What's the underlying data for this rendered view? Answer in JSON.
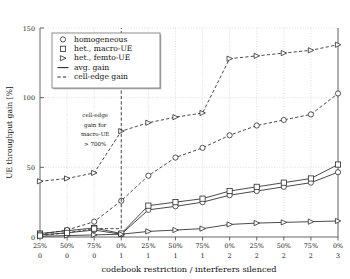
{
  "chart_data": {
    "type": "line",
    "title": "",
    "xlabel": "codebook restriction / interferers silenced",
    "ylabel": "UE throughput gain [%]",
    "ylim": [
      0,
      150
    ],
    "yticks": [
      0,
      50,
      100,
      150
    ],
    "yticklabels": [
      "0",
      "50",
      "100",
      "150"
    ],
    "grid": true,
    "legend_position": "upper left",
    "x_tick_labels_row1": [
      "25%",
      "50%",
      "75%",
      "0%",
      "25%",
      "50%",
      "75%",
      "0%",
      "25%",
      "50%",
      "75%",
      "0%"
    ],
    "x_tick_labels_row2": [
      "0",
      "0",
      "0",
      "1",
      "1",
      "1",
      "1",
      "2",
      "2",
      "2",
      "2",
      "3"
    ],
    "legend": [
      {
        "label": "homogeneous",
        "marker": "circle",
        "style": "marker"
      },
      {
        "label": "het., macro-UE",
        "marker": "square",
        "style": "marker"
      },
      {
        "label": "het., femto-UE",
        "marker": "triangle-right",
        "style": "marker"
      },
      {
        "label": "avg. gain",
        "marker": "none",
        "style": "solid"
      },
      {
        "label": "cell-edge gain",
        "marker": "none",
        "style": "dashed"
      }
    ],
    "annotation": {
      "lines": [
        "cell-edge",
        "gain for",
        "macro-UE",
        "> 700%"
      ],
      "x_index": 2
    },
    "series": [
      {
        "name": "homogeneous avg. gain",
        "marker": "circle",
        "style": "solid",
        "values": [
          1.5,
          3.0,
          5.0,
          2.0,
          19.5,
          22.0,
          25.0,
          30.0,
          33.0,
          36.0,
          39.0,
          46.5
        ]
      },
      {
        "name": "het., macro-UE avg. gain",
        "marker": "square",
        "style": "solid",
        "values": [
          2.5,
          4.5,
          6.5,
          2.5,
          22.5,
          25.0,
          27.5,
          33.0,
          36.0,
          39.0,
          42.0,
          52.0
        ]
      },
      {
        "name": "het., femto-UE avg. gain",
        "marker": "triangle-right",
        "style": "solid",
        "values": [
          0.5,
          1.0,
          1.5,
          2.0,
          4.0,
          5.0,
          6.0,
          9.0,
          10.0,
          10.5,
          11.0,
          11.5
        ]
      },
      {
        "name": "homogeneous cell-edge gain",
        "marker": "circle",
        "style": "dashed",
        "values": [
          2.0,
          5.0,
          11.0,
          26.0,
          44.0,
          57.0,
          64.0,
          73.0,
          80.0,
          84.0,
          88.0,
          103.0
        ]
      },
      {
        "name": "het., femto-UE cell-edge gain",
        "marker": "triangle-right",
        "style": "dashed",
        "values": [
          40.0,
          42.0,
          46.0,
          76.0,
          82.0,
          86.0,
          89.0,
          128.0,
          130.0,
          132.0,
          134.0,
          138.0
        ]
      },
      {
        "name": "het., macro-UE cell-edge gain",
        "marker": "square",
        "style": "dashed",
        "values": [
          1.0,
          3.0,
          6.0,
          null,
          null,
          null,
          null,
          null,
          null,
          null,
          null,
          null
        ],
        "offscale_spike_at_index": 3,
        "offscale_note": "> 700%"
      }
    ]
  },
  "colors": {
    "line": "#2b2b2b",
    "grid": "#c8c8c8",
    "axis": "#555555",
    "legend_border": "#808080",
    "background": "#ffffff"
  }
}
